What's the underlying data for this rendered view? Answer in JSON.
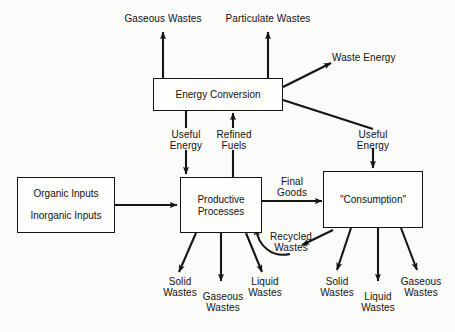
{
  "diagram": {
    "background_color": "#fbfbfa",
    "line_color": "#151515",
    "text_color": "#111111",
    "nodes": [
      {
        "id": "energy-conversion",
        "label": "Energy Conversion"
      },
      {
        "id": "inputs",
        "label_line1": "Organic Inputs",
        "label_line2": "Inorganic Inputs"
      },
      {
        "id": "productive-processes",
        "label_line1": "Productive",
        "label_line2": "Processes"
      },
      {
        "id": "consumption",
        "label": "\"Consumption\""
      }
    ],
    "flow_labels": {
      "gaseous_wastes_top": "Gaseous Wastes",
      "particulate_wastes_top": "Particulate Wastes",
      "waste_energy": "Waste Energy",
      "useful_energy_left_line1": "Useful",
      "useful_energy_left_line2": "Energy",
      "refined_fuels_line1": "Refined",
      "refined_fuels_line2": "Fuels",
      "useful_energy_right_line1": "Useful",
      "useful_energy_right_line2": "Energy",
      "final_goods_line1": "Final",
      "final_goods_line2": "Goods",
      "recycled_wastes_line1": "Recycled",
      "recycled_wastes_line2": "Wastes",
      "pp_solid_line1": "Solid",
      "pp_solid_line2": "Wastes",
      "pp_gaseous_line1": "Gaseous",
      "pp_gaseous_line2": "Wastes",
      "pp_liquid_line1": "Liquid",
      "pp_liquid_line2": "Wastes",
      "cons_solid_line1": "Solid",
      "cons_solid_line2": "Wastes",
      "cons_liquid_line1": "Liquid",
      "cons_liquid_line2": "Wastes",
      "cons_gaseous_line1": "Gaseous",
      "cons_gaseous_line2": "Wastes"
    }
  }
}
